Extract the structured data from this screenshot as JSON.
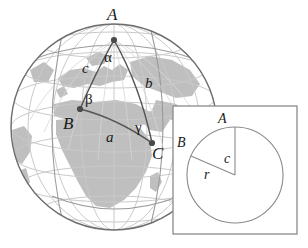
{
  "figure": {
    "colors": {
      "ocean": "#ffffff",
      "land": "#bfbfbf",
      "graticule": "#c9c9c9",
      "outline": "#6e6e6e",
      "triangle_arc": "#555555",
      "vertex_dot": "#4a4a4a",
      "inset_border": "#8a8a8a",
      "inset_bg": "#ffffff",
      "circle_stroke": "#8a8a8a",
      "label": "#1a1a1a"
    }
  },
  "globe": {
    "vertices": [
      {
        "id": "A",
        "label": "A",
        "cx": 114,
        "cy": 40,
        "label_x": 107,
        "label_y": 6
      },
      {
        "id": "B",
        "label": "B",
        "cx": 80,
        "cy": 109,
        "label_x": 63,
        "label_y": 115
      },
      {
        "id": "C",
        "label": "C",
        "cx": 152,
        "cy": 143,
        "label_x": 152,
        "label_y": 145
      }
    ],
    "angles": [
      {
        "id": "alpha",
        "label": "α",
        "at_vertex": "A",
        "x": 104,
        "y": 50
      },
      {
        "id": "beta",
        "label": "β",
        "at_vertex": "B",
        "x": 85,
        "y": 92
      },
      {
        "id": "gamma",
        "label": "γ",
        "at_vertex": "C",
        "x": 135,
        "y": 120
      }
    ],
    "sides": [
      {
        "id": "a",
        "label": "a",
        "between": "B-C",
        "x": 106,
        "y": 130
      },
      {
        "id": "b",
        "label": "b",
        "between": "A-C",
        "x": 145,
        "y": 76
      },
      {
        "id": "c",
        "label": "c",
        "between": "A-B",
        "x": 82,
        "y": 61
      }
    ]
  },
  "inset": {
    "vertices": [
      {
        "id": "A",
        "label": "A",
        "x": 218,
        "y": 112
      },
      {
        "id": "B",
        "label": "B",
        "x": 177,
        "y": 136
      }
    ],
    "measures": [
      {
        "id": "c",
        "label": "c",
        "x": 224,
        "y": 152
      },
      {
        "id": "r",
        "label": "r",
        "x": 204,
        "y": 168
      }
    ]
  }
}
